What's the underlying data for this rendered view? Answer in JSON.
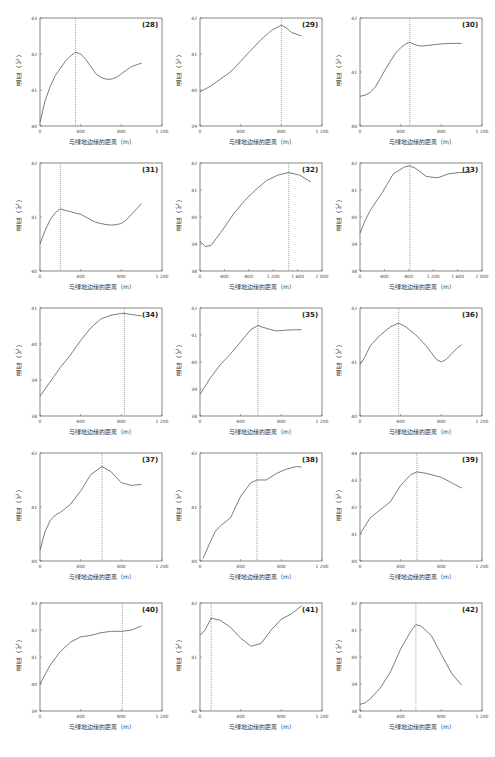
{
  "figure": {
    "xlabel": "与绿地边缘的距离（m）",
    "ylabel": "温度（℃）"
  },
  "chart_data": [
    {
      "id": "(28)",
      "type": "line",
      "title": "(28)",
      "xlabel": "与绿地边缘的距离（m）",
      "ylabel": "温度（℃）",
      "xlim": [
        0,
        1200
      ],
      "ylim": [
        40,
        43
      ],
      "xticks": [
        "0",
        "400",
        "800",
        "1 200"
      ],
      "yticks": [
        "40",
        "41",
        "42",
        "43"
      ],
      "marker_x": 350,
      "x": [
        0,
        50,
        100,
        150,
        200,
        250,
        300,
        350,
        400,
        450,
        500,
        550,
        600,
        650,
        700,
        750,
        800,
        850,
        900,
        950,
        1000
      ],
      "y": [
        40.1,
        40.7,
        41.1,
        41.4,
        41.6,
        41.8,
        41.95,
        42.05,
        42.0,
        41.85,
        41.65,
        41.45,
        41.35,
        41.3,
        41.3,
        41.35,
        41.45,
        41.55,
        41.65,
        41.7,
        41.75
      ]
    },
    {
      "id": "(29)",
      "type": "line",
      "title": "(29)",
      "xlabel": "与绿地边缘的距离（m）",
      "ylabel": "温度（℃）",
      "xlim": [
        0,
        1200
      ],
      "ylim": [
        39,
        42
      ],
      "xticks": [
        "0",
        "400",
        "800",
        "1 200"
      ],
      "yticks": [
        "39",
        "40",
        "41",
        "42"
      ],
      "marker_x": 800,
      "x": [
        0,
        100,
        200,
        300,
        400,
        500,
        600,
        700,
        800,
        850,
        900,
        1000
      ],
      "y": [
        39.95,
        40.1,
        40.3,
        40.5,
        40.8,
        41.1,
        41.4,
        41.65,
        41.8,
        41.72,
        41.6,
        41.5
      ]
    },
    {
      "id": "(30)",
      "type": "line",
      "title": "(30)",
      "xlabel": "与绿地边缘的距离（m）",
      "ylabel": "温度（℃）",
      "xlim": [
        0,
        1200
      ],
      "ylim": [
        40,
        42
      ],
      "xticks": [
        "0",
        "400",
        "800",
        "1 200"
      ],
      "yticks": [
        "40",
        "41",
        "42"
      ],
      "marker_x": 490,
      "x": [
        0,
        50,
        100,
        150,
        200,
        250,
        300,
        350,
        400,
        450,
        490,
        550,
        600,
        700,
        800,
        900,
        1000
      ],
      "y": [
        40.55,
        40.57,
        40.62,
        40.72,
        40.88,
        41.05,
        41.2,
        41.35,
        41.45,
        41.52,
        41.55,
        41.5,
        41.48,
        41.5,
        41.52,
        41.53,
        41.53
      ]
    },
    {
      "id": "(31)",
      "type": "line",
      "title": "(31)",
      "xlabel": "与绿地边缘的距离（m）",
      "ylabel": "温度（℃）",
      "xlim": [
        0,
        1200
      ],
      "ylim": [
        40,
        42
      ],
      "xticks": [
        "0",
        "400",
        "800",
        "1 200"
      ],
      "yticks": [
        "40",
        "41",
        "42"
      ],
      "marker_x": 200,
      "x": [
        0,
        50,
        100,
        150,
        200,
        250,
        300,
        350,
        400,
        450,
        500,
        550,
        600,
        650,
        700,
        750,
        800,
        850,
        900,
        950,
        1000
      ],
      "y": [
        40.5,
        40.75,
        40.95,
        41.08,
        41.15,
        41.12,
        41.1,
        41.07,
        41.05,
        41.0,
        40.95,
        40.9,
        40.88,
        40.86,
        40.85,
        40.86,
        40.88,
        40.95,
        41.05,
        41.15,
        41.25
      ]
    },
    {
      "id": "(32)",
      "type": "line",
      "title": "(32)",
      "xlabel": "与绿地边缘的距离（m）",
      "ylabel": "温度（℃）",
      "xlim": [
        0,
        2200
      ],
      "ylim": [
        38,
        42
      ],
      "xticks": [
        "0",
        "400",
        "800",
        "1 200",
        "1 600",
        "2 000"
      ],
      "yticks": [
        "38",
        "39",
        "40",
        "41",
        "42"
      ],
      "marker_x": 1600,
      "x": [
        0,
        100,
        200,
        400,
        600,
        800,
        1000,
        1200,
        1400,
        1600,
        1800,
        2000
      ],
      "y": [
        39.1,
        38.9,
        38.95,
        39.5,
        40.1,
        40.6,
        41.0,
        41.35,
        41.55,
        41.65,
        41.55,
        41.3
      ]
    },
    {
      "id": "(33)",
      "type": "line",
      "title": "(33)",
      "xlabel": "与绿地边缘的距离（m）",
      "ylabel": "温度（℃）",
      "xlim": [
        0,
        2200
      ],
      "ylim": [
        38,
        42
      ],
      "xticks": [
        "0",
        "400",
        "800",
        "1 200",
        "1 600",
        "2 000"
      ],
      "yticks": [
        "38",
        "39",
        "40",
        "41",
        "42"
      ],
      "marker_x": 900,
      "x": [
        0,
        100,
        200,
        400,
        600,
        800,
        900,
        1000,
        1200,
        1400,
        1600,
        1800,
        2000
      ],
      "y": [
        39.4,
        39.9,
        40.3,
        40.9,
        41.6,
        41.85,
        41.9,
        41.8,
        41.5,
        41.45,
        41.6,
        41.65,
        41.65
      ]
    },
    {
      "id": "(34)",
      "type": "line",
      "title": "(34)",
      "xlabel": "与绿地边缘的距离（m）",
      "ylabel": "温度（℃）",
      "xlim": [
        0,
        1200
      ],
      "ylim": [
        38,
        41
      ],
      "xticks": [
        "0",
        "400",
        "800",
        "1 200"
      ],
      "yticks": [
        "38",
        "39",
        "40",
        "41"
      ],
      "marker_x": 830,
      "x": [
        0,
        100,
        200,
        300,
        400,
        500,
        600,
        700,
        800,
        830,
        900,
        1000
      ],
      "y": [
        38.55,
        38.95,
        39.35,
        39.7,
        40.1,
        40.45,
        40.7,
        40.8,
        40.85,
        40.85,
        40.82,
        40.78
      ]
    },
    {
      "id": "(35)",
      "type": "line",
      "title": "(35)",
      "xlabel": "与绿地边缘的距离（m）",
      "ylabel": "温度（℃）",
      "xlim": [
        0,
        1200
      ],
      "ylim": [
        38,
        42
      ],
      "xticks": [
        "0",
        "400",
        "800",
        "1 200"
      ],
      "yticks": [
        "38",
        "39",
        "40",
        "41",
        "42"
      ],
      "marker_x": 570,
      "x": [
        0,
        100,
        200,
        300,
        400,
        500,
        570,
        650,
        750,
        850,
        1000
      ],
      "y": [
        38.8,
        39.4,
        39.9,
        40.3,
        40.75,
        41.2,
        41.35,
        41.25,
        41.15,
        41.18,
        41.2
      ]
    },
    {
      "id": "(36)",
      "type": "line",
      "title": "(36)",
      "xlabel": "与绿地边缘的距离（m）",
      "ylabel": "温度（℃）",
      "xlim": [
        0,
        1200
      ],
      "ylim": [
        40,
        42
      ],
      "xticks": [
        "0",
        "400",
        "800",
        "1 200"
      ],
      "yticks": [
        "40",
        "41",
        "42"
      ],
      "marker_x": 380,
      "x": [
        0,
        50,
        100,
        200,
        300,
        380,
        450,
        550,
        650,
        750,
        800,
        850,
        900,
        950,
        1000
      ],
      "y": [
        40.95,
        41.1,
        41.3,
        41.5,
        41.65,
        41.72,
        41.65,
        41.5,
        41.3,
        41.05,
        41.0,
        41.05,
        41.15,
        41.25,
        41.32
      ]
    },
    {
      "id": "(37)",
      "type": "line",
      "title": "(37)",
      "xlabel": "与绿地边缘的距离（m）",
      "ylabel": "温度（℃）",
      "xlim": [
        0,
        1200
      ],
      "ylim": [
        40,
        42
      ],
      "xticks": [
        "0",
        "400",
        "800",
        "1 200"
      ],
      "yticks": [
        "40",
        "41",
        "42"
      ],
      "marker_x": 610,
      "x": [
        0,
        50,
        100,
        150,
        200,
        300,
        400,
        500,
        610,
        700,
        800,
        900,
        1000
      ],
      "y": [
        40.2,
        40.55,
        40.75,
        40.85,
        40.9,
        41.05,
        41.3,
        41.6,
        41.75,
        41.65,
        41.45,
        41.4,
        41.42
      ]
    },
    {
      "id": "(38)",
      "type": "line",
      "title": "(38)",
      "xlabel": "与绿地边缘的距离（m）",
      "ylabel": "温度（℃）",
      "xlim": [
        0,
        1200
      ],
      "ylim": [
        40,
        42
      ],
      "xticks": [
        "0",
        "400",
        "800",
        "1 200"
      ],
      "yticks": [
        "40",
        "41",
        "42"
      ],
      "marker_x": 560,
      "x": [
        30,
        100,
        150,
        200,
        300,
        400,
        500,
        560,
        650,
        750,
        850,
        950,
        1000
      ],
      "y": [
        40.05,
        40.35,
        40.55,
        40.65,
        40.8,
        41.2,
        41.45,
        41.5,
        41.5,
        41.62,
        41.7,
        41.75,
        41.74
      ]
    },
    {
      "id": "(39)",
      "type": "line",
      "title": "(39)",
      "xlabel": "与绿地边缘的距离（m）",
      "ylabel": "温度（℃）",
      "xlim": [
        0,
        1200
      ],
      "ylim": [
        40,
        44
      ],
      "xticks": [
        "0",
        "400",
        "800",
        "1 200"
      ],
      "yticks": [
        "40",
        "41",
        "42",
        "43",
        "44"
      ],
      "marker_x": 560,
      "x": [
        0,
        100,
        200,
        300,
        400,
        500,
        560,
        650,
        800,
        900,
        1000
      ],
      "y": [
        41.0,
        41.6,
        41.9,
        42.2,
        42.8,
        43.2,
        43.3,
        43.25,
        43.1,
        42.9,
        42.7
      ]
    },
    {
      "id": "(40)",
      "type": "line",
      "title": "(40)",
      "xlabel": "与绿地边缘的距离（m）",
      "ylabel": "温度（℃）",
      "xlim": [
        0,
        1200
      ],
      "ylim": [
        39,
        43
      ],
      "xticks": [
        "0",
        "400",
        "800",
        "1 200"
      ],
      "yticks": [
        "39",
        "40",
        "41",
        "42",
        "43"
      ],
      "marker_x": 810,
      "x": [
        0,
        50,
        100,
        200,
        300,
        400,
        500,
        600,
        700,
        810,
        900,
        1000
      ],
      "y": [
        40.0,
        40.35,
        40.7,
        41.2,
        41.55,
        41.75,
        41.8,
        41.9,
        41.95,
        41.95,
        42.0,
        42.15
      ]
    },
    {
      "id": "(41)",
      "type": "line",
      "title": "(41)",
      "xlabel": "与绿地边缘的距离（m）",
      "ylabel": "温度（℃）",
      "xlim": [
        0,
        1200
      ],
      "ylim": [
        40,
        42
      ],
      "xticks": [
        "0",
        "400",
        "800",
        "1 200"
      ],
      "yticks": [
        "40",
        "41",
        "42"
      ],
      "marker_x": 110,
      "x": [
        0,
        50,
        110,
        200,
        300,
        400,
        500,
        600,
        700,
        800,
        900,
        1000
      ],
      "y": [
        41.4,
        41.5,
        41.72,
        41.68,
        41.55,
        41.35,
        41.2,
        41.25,
        41.5,
        41.7,
        41.8,
        41.95
      ]
    },
    {
      "id": "(42)",
      "type": "line",
      "title": "(42)",
      "xlabel": "与绿地边缘的距离（m）",
      "ylabel": "温度（℃）",
      "xlim": [
        0,
        1200
      ],
      "ylim": [
        38,
        42
      ],
      "xticks": [
        "0",
        "400",
        "800",
        "1 200"
      ],
      "yticks": [
        "38",
        "39",
        "40",
        "41",
        "42"
      ],
      "marker_x": 550,
      "x": [
        0,
        50,
        100,
        200,
        300,
        400,
        500,
        550,
        600,
        700,
        800,
        900,
        1000
      ],
      "y": [
        38.25,
        38.3,
        38.45,
        38.85,
        39.45,
        40.3,
        40.95,
        41.2,
        41.15,
        40.8,
        40.1,
        39.4,
        38.95
      ]
    }
  ]
}
